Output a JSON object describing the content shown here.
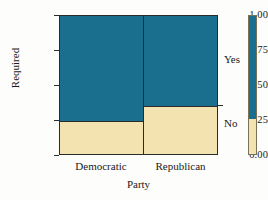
{
  "chart_data": {
    "type": "bar",
    "subtype": "stacked-proportion-mosaic",
    "title": "",
    "xlabel": "Party",
    "ylabel": "Required",
    "categories": [
      "Democratic",
      "Republican"
    ],
    "ylim": [
      0.0,
      1.0
    ],
    "yticks": [
      "0.00",
      "0.25",
      "0.50",
      "0.75",
      "1.00"
    ],
    "ytick_values": [
      0.0,
      0.25,
      0.5,
      0.75,
      1.0
    ],
    "grid": false,
    "legend_position": "right",
    "series": [
      {
        "name": "No",
        "values": [
          0.25,
          0.355
        ],
        "color": "#f2e3b0"
      },
      {
        "name": "Yes",
        "values": [
          0.75,
          0.645
        ],
        "color": "#1a6e8e"
      }
    ],
    "legend_entries": [
      {
        "label": "Yes",
        "color": "#1a6e8e"
      },
      {
        "label": "No",
        "color": "#f2e3b0"
      }
    ],
    "bar_widths": [
      0.53,
      0.47
    ],
    "annotations": []
  },
  "colors": {
    "yes": "#1a6e8e",
    "no": "#f2e3b0",
    "axis": "#2b2b2b",
    "text": "#1a1a1a",
    "background": "#fdfdfb"
  }
}
